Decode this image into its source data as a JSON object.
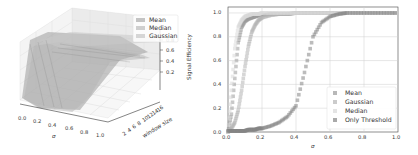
{
  "chart_data": [
    {
      "type": "surface3d",
      "title": "",
      "xlabel": "σ",
      "ylabel": "window size",
      "zlabel": "Signal Efficiency",
      "x_ticks": [
        "0.0",
        "0.2",
        "0.4",
        "0.6",
        "0.8",
        "1.0"
      ],
      "y_ticks": [
        "2",
        "4",
        "6",
        "8",
        "10",
        "12",
        "14",
        "16"
      ],
      "z_ticks": [
        "0.2",
        "0.4",
        "0.6",
        "0.8"
      ],
      "legend": {
        "position": "upper right",
        "entries": [
          "Mean",
          "Median",
          "Gaussian"
        ]
      },
      "series": [
        {
          "name": "Mean",
          "description": "surface rising steeply from ~0 at σ=0 to ~0.85 plateau for larger window sizes"
        },
        {
          "name": "Median",
          "description": "surface rising from ~0 to ~0.7 plateau"
        },
        {
          "name": "Gaussian",
          "description": "surface rising from ~0 to ~0.7 plateau"
        }
      ],
      "xlim": [
        0.0,
        1.0
      ],
      "zlim": [
        0.0,
        0.9
      ]
    },
    {
      "type": "scatter",
      "title": "",
      "xlabel": "σ",
      "ylabel": "Signal efficiency",
      "xlim": [
        0.0,
        1.0
      ],
      "ylim": [
        0.0,
        1.05
      ],
      "grid": true,
      "x_ticks": [
        "0.0",
        "0.2",
        "0.4",
        "0.6",
        "0.8",
        "1.0"
      ],
      "y_ticks": [
        "0.0",
        "0.2",
        "0.4",
        "0.6",
        "0.8",
        "1.0"
      ],
      "legend": {
        "position": "lower right",
        "entries": [
          "Mean",
          "Gaussian",
          "Median",
          "Only Threshold"
        ]
      },
      "x": [
        0.0,
        0.02,
        0.04,
        0.06,
        0.08,
        0.1,
        0.12,
        0.14,
        0.16,
        0.18,
        0.2,
        0.25,
        0.3,
        0.35,
        0.4,
        0.45,
        0.5,
        0.55,
        0.6,
        0.65,
        0.7,
        0.8,
        0.9,
        1.0
      ],
      "series": [
        {
          "name": "Mean",
          "color": "#9a9a9a",
          "values": [
            0.0,
            0.15,
            0.45,
            0.75,
            0.88,
            0.93,
            0.95,
            0.96,
            0.97,
            0.98,
            0.98,
            0.99,
            0.99,
            0.99,
            1.0,
            1.0,
            1.0,
            1.0,
            1.0,
            1.0,
            1.0,
            1.0,
            1.0,
            1.0
          ]
        },
        {
          "name": "Gaussian",
          "color": "#b5b5b5",
          "values": [
            0.0,
            0.03,
            0.08,
            0.18,
            0.35,
            0.55,
            0.72,
            0.84,
            0.9,
            0.94,
            0.96,
            0.98,
            0.99,
            0.99,
            1.0,
            1.0,
            1.0,
            1.0,
            1.0,
            1.0,
            1.0,
            1.0,
            1.0,
            1.0
          ]
        },
        {
          "name": "Median",
          "color": "#d8d8d8",
          "values": [
            0.0,
            0.35,
            0.7,
            0.88,
            0.94,
            0.97,
            0.98,
            0.99,
            0.99,
            0.99,
            1.0,
            1.0,
            1.0,
            1.0,
            1.0,
            1.0,
            1.0,
            1.0,
            1.0,
            1.0,
            1.0,
            1.0,
            1.0,
            1.0
          ]
        },
        {
          "name": "Only Threshold",
          "color": "#858585",
          "values": [
            0.01,
            0.01,
            0.01,
            0.01,
            0.01,
            0.01,
            0.02,
            0.02,
            0.02,
            0.03,
            0.03,
            0.05,
            0.08,
            0.13,
            0.22,
            0.5,
            0.8,
            0.92,
            0.97,
            0.99,
            1.0,
            1.0,
            1.0,
            1.0
          ]
        }
      ]
    }
  ],
  "left": {
    "legend": [
      "Mean",
      "Median",
      "Gaussian"
    ],
    "zlabel": "Signal Efficiency",
    "xlabel": "σ",
    "ylabel": "window size",
    "x_ticks": [
      "0.0",
      "0.2",
      "0.4",
      "0.6",
      "0.8",
      "1.0"
    ],
    "y_ticks": [
      "2",
      "4",
      "6",
      "8",
      "10",
      "12",
      "14",
      "16"
    ],
    "z_ticks": [
      "0.2",
      "0.4",
      "0.6",
      "0.8"
    ]
  },
  "right": {
    "legend": [
      "Mean",
      "Gaussian",
      "Median",
      "Only Threshold"
    ],
    "ylabel": "Signal efficiency",
    "xlabel": "σ",
    "x_ticks": [
      "0.0",
      "0.2",
      "0.4",
      "0.6",
      "0.8",
      "1.0"
    ],
    "y_ticks": [
      "0.0",
      "0.2",
      "0.4",
      "0.6",
      "0.8",
      "1.0"
    ]
  }
}
